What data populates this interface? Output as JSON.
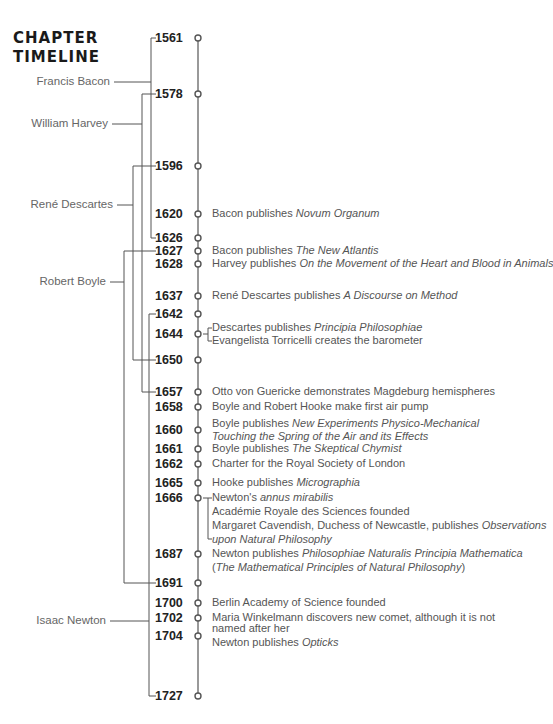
{
  "title": {
    "line1": "CHAPTER",
    "line2": "TIMELINE"
  },
  "colors": {
    "line": "#555555",
    "text": "#555555",
    "year": "#222222",
    "title": "#1a1a1a"
  },
  "people": [
    {
      "name": "Francis Bacon",
      "born": 1561,
      "died": 1626
    },
    {
      "name": "William Harvey",
      "born": 1578,
      "died": 1657
    },
    {
      "name": "René Descartes",
      "born": 1596,
      "died": 1650
    },
    {
      "name": "Robert Boyle",
      "born": 1627,
      "died": 1691
    },
    {
      "name": "Isaac Newton",
      "born": 1642,
      "died": 1727
    }
  ],
  "years": [
    "1561",
    "1578",
    "1596",
    "1620",
    "1626",
    "1627",
    "1628",
    "1637",
    "1642",
    "1644",
    "1650",
    "1657",
    "1658",
    "1660",
    "1661",
    "1662",
    "1665",
    "1666",
    "1687",
    "1691",
    "1700",
    "1702",
    "1704",
    "1727"
  ],
  "events": [
    {
      "year": "1620",
      "parts": [
        {
          "t": "Bacon publishes "
        },
        {
          "t": "Novum Organum",
          "i": true
        }
      ]
    },
    {
      "year": "1627",
      "parts": [
        {
          "t": "Bacon publishes "
        },
        {
          "t": "The New Atlantis",
          "i": true
        }
      ]
    },
    {
      "year": "1628",
      "parts": [
        {
          "t": "Harvey publishes "
        },
        {
          "t": "On the Movement of the Heart and Blood in Animals",
          "i": true
        }
      ]
    },
    {
      "year": "1637",
      "parts": [
        {
          "t": "René Descartes publishes "
        },
        {
          "t": "A Discourse on Method",
          "i": true
        }
      ]
    },
    {
      "year": "1644",
      "parts": [
        {
          "t": "Descartes publishes "
        },
        {
          "t": "Principia Philosophiae",
          "i": true
        }
      ]
    },
    {
      "year": "1644",
      "parts": [
        {
          "t": "Evangelista Torricelli creates the barometer"
        }
      ]
    },
    {
      "year": "1657",
      "parts": [
        {
          "t": "Otto von Guericke demonstrates Magdeburg hemispheres"
        }
      ]
    },
    {
      "year": "1658",
      "parts": [
        {
          "t": "Boyle and Robert Hooke make first air pump"
        }
      ]
    },
    {
      "year": "1660",
      "parts": [
        {
          "t": "Boyle publishes "
        },
        {
          "t": "New Experiments Physico-Mechanical",
          "i": true
        }
      ]
    },
    {
      "year": "1660",
      "parts": [
        {
          "t": "Touching the Spring of the Air and its Effects",
          "i": true
        }
      ]
    },
    {
      "year": "1661",
      "parts": [
        {
          "t": "Boyle publishes "
        },
        {
          "t": "The Skeptical Chymist",
          "i": true
        }
      ]
    },
    {
      "year": "1662",
      "parts": [
        {
          "t": "Charter for the Royal Society of London"
        }
      ]
    },
    {
      "year": "1665",
      "parts": [
        {
          "t": "Hooke publishes "
        },
        {
          "t": "Micrographia",
          "i": true
        }
      ]
    },
    {
      "year": "1666",
      "parts": [
        {
          "t": "Newton's "
        },
        {
          "t": "annus mirabilis",
          "i": true
        }
      ]
    },
    {
      "year": "1666",
      "parts": [
        {
          "t": "Académie Royale des Sciences founded"
        }
      ]
    },
    {
      "year": "1666",
      "parts": [
        {
          "t": "Margaret Cavendish, Duchess of Newcastle, publishes "
        },
        {
          "t": "Observations",
          "i": true
        }
      ]
    },
    {
      "year": "1666",
      "parts": [
        {
          "t": "upon Natural Philosophy",
          "i": true
        }
      ]
    },
    {
      "year": "1687",
      "parts": [
        {
          "t": "Newton publishes "
        },
        {
          "t": "Philosophiae Naturalis Principia Mathematica",
          "i": true
        }
      ]
    },
    {
      "year": "1687",
      "parts": [
        {
          "t": "("
        },
        {
          "t": "The Mathematical Principles of Natural Philosophy",
          "i": true
        },
        {
          "t": ")"
        }
      ]
    },
    {
      "year": "1700",
      "parts": [
        {
          "t": "Berlin Academy of Science founded"
        }
      ]
    },
    {
      "year": "1702",
      "parts": [
        {
          "t": "Maria Winkelmann discovers new comet, although it is not"
        }
      ]
    },
    {
      "year": "1702",
      "parts": [
        {
          "t": "named after her"
        }
      ]
    },
    {
      "year": "1704",
      "parts": [
        {
          "t": "Newton publishes "
        },
        {
          "t": "Opticks",
          "i": true
        }
      ]
    }
  ]
}
